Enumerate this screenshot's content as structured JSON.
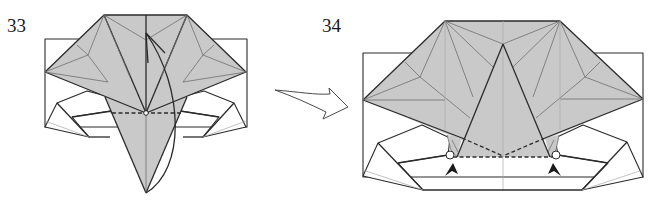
{
  "diagram": {
    "type": "origami-instruction",
    "steps": [
      {
        "number": "33",
        "description": "Valley fold the bottom flap up along the dashed line",
        "symbols": [
          "valley-fold-line",
          "fold-arrow",
          "pivot-point"
        ]
      },
      {
        "number": "34",
        "description": "Result with triangular flap folded up; squash/reverse points indicated",
        "symbols": [
          "valley-fold-line",
          "push-arrow-left",
          "push-arrow-right",
          "pivot-circle-left",
          "pivot-circle-right"
        ]
      }
    ],
    "transition_arrow": "hollow-arrow-right",
    "colors": {
      "shaded_paper": "#c9c9c9",
      "line": "#2b2b2b",
      "crease": "#6e6e6e",
      "background": "#ffffff"
    }
  }
}
